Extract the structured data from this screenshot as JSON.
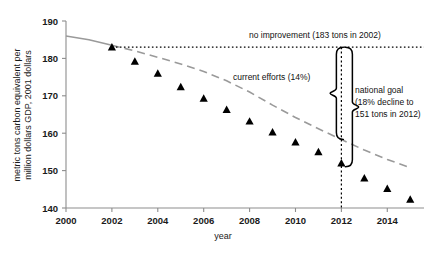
{
  "chart_data": {
    "type": "scatter",
    "title": "",
    "xlabel": "year",
    "ylabel": "metric tons carbon equivalent per million dollars GDP, 2001 dollars",
    "ylabel_line1": "metric tons carbon equivalent per",
    "ylabel_line2": "million dollars GDP, 2001 dollars",
    "xlim": [
      2000,
      2015.6
    ],
    "ylim": [
      140,
      190
    ],
    "grid": false,
    "legend_position": "none",
    "xticks": [
      2000,
      2002,
      2004,
      2006,
      2008,
      2010,
      2012,
      2014
    ],
    "xtick_labels": [
      "2000",
      "2002",
      "2004",
      "2006",
      "2008",
      "2010",
      "2012",
      "2014"
    ],
    "yticks": [
      140,
      150,
      160,
      170,
      180,
      190
    ],
    "ytick_labels": [
      "140",
      "150",
      "160",
      "170",
      "180",
      "190"
    ],
    "series": [
      {
        "name": "observed data",
        "type": "scatter",
        "marker": "triangle",
        "color": "#000000",
        "x": [
          2002,
          2003,
          2004,
          2005,
          2006,
          2007,
          2008,
          2009,
          2010,
          2011,
          2012,
          2013,
          2014,
          2015
        ],
        "values": [
          183.0,
          179.2,
          176.0,
          172.4,
          169.3,
          166.3,
          163.2,
          160.3,
          157.6,
          155.0,
          152.0,
          148.0,
          145.2,
          142.3
        ]
      },
      {
        "name": "current efforts trend",
        "type": "line",
        "style": "solid-then-dashed",
        "color": "#9a9a9a",
        "x": [
          2000,
          2001,
          2002,
          2003,
          2004,
          2005,
          2006,
          2007,
          2008,
          2009,
          2010,
          2011,
          2012,
          2013,
          2014,
          2015
        ],
        "values": [
          186.0,
          185.0,
          183.5,
          182.0,
          180.3,
          178.5,
          176.5,
          174.0,
          171.0,
          167.5,
          164.2,
          161.2,
          158.3,
          155.5,
          153.0,
          150.8
        ]
      },
      {
        "name": "no improvement baseline",
        "type": "line",
        "style": "dotted",
        "color": "#000000",
        "x": [
          2002,
          2015.6
        ],
        "values": [
          183,
          183
        ]
      }
    ],
    "reference_lines": [
      {
        "name": "year-2012-marker",
        "orientation": "vertical",
        "value": 2012,
        "style": "dotted",
        "color": "#000000"
      }
    ],
    "annotations": [
      {
        "name": "no-improvement",
        "text": "no improvement (183 tons in 2002)"
      },
      {
        "name": "current-efforts",
        "text": "current efforts (14%)"
      },
      {
        "name": "national-goal-line1",
        "text": "national goal"
      },
      {
        "name": "national-goal-line2",
        "text": "(18% decline to"
      },
      {
        "name": "national-goal-line3",
        "text": "151 tons in 2012)"
      }
    ],
    "braces": [
      {
        "name": "current-efforts-brace",
        "from": 183,
        "to": 158.3,
        "at_year": 2012,
        "direction": "left"
      },
      {
        "name": "national-goal-brace",
        "from": 183,
        "to": 151,
        "at_year": 2012,
        "direction": "right"
      }
    ]
  },
  "colors": {
    "axis": "#888888",
    "marker": "#000000",
    "trend": "#9a9a9a",
    "text": "#111111"
  }
}
